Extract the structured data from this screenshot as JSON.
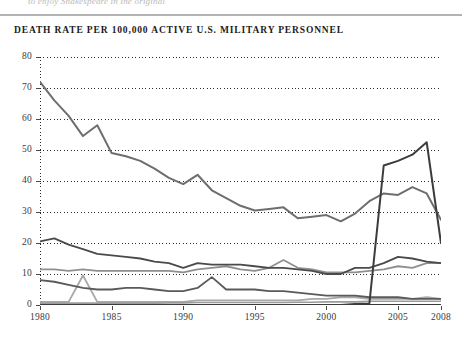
{
  "page": {
    "top_caption": "to enjoy Shakespeare in the original"
  },
  "chart_data": {
    "type": "line",
    "title": "DEATH RATE PER 100,000 ACTIVE U.S. MILITARY PERSONNEL",
    "xlabel": "",
    "ylabel": "",
    "xlim": [
      1980,
      2008
    ],
    "ylim": [
      0,
      80
    ],
    "grid": true,
    "legend": "none",
    "y_ticks": [
      0,
      10,
      20,
      30,
      40,
      50,
      60,
      70,
      80
    ],
    "x_ticks": [
      1980,
      1985,
      1990,
      1995,
      2000,
      2005,
      2008
    ],
    "x": [
      1980,
      1981,
      1982,
      1983,
      1984,
      1985,
      1986,
      1987,
      1988,
      1989,
      1990,
      1991,
      1992,
      1993,
      1994,
      1995,
      1996,
      1997,
      1998,
      1999,
      2000,
      2001,
      2002,
      2003,
      2004,
      2005,
      2006,
      2007,
      2008
    ],
    "series": [
      {
        "name": "total-death-rate",
        "color": "#6e6e6e",
        "width": 2.0,
        "values": [
          72.0,
          66.0,
          61.0,
          54.5,
          58.0,
          49.0,
          48.0,
          46.5,
          44.0,
          41.0,
          39.0,
          42.0,
          37.0,
          34.5,
          32.0,
          30.5,
          31.0,
          31.5,
          28.0,
          28.5,
          29.0,
          27.0,
          29.5,
          33.5,
          36.0,
          35.5,
          38.0,
          36.0,
          27.5
        ]
      },
      {
        "name": "hostile-action-spike",
        "color": "#3c3c3c",
        "width": 2.0,
        "values": [
          0.0,
          0.0,
          0.0,
          0.0,
          0.0,
          0.0,
          0.0,
          0.0,
          0.0,
          0.0,
          0.0,
          0.0,
          0.0,
          0.0,
          0.0,
          0.0,
          0.0,
          0.0,
          0.0,
          0.0,
          0.0,
          0.0,
          0.3,
          0.5,
          45.0,
          46.5,
          48.5,
          52.5,
          20.0
        ]
      },
      {
        "name": "accident-rate",
        "color": "#4a4a4a",
        "width": 1.8,
        "values": [
          20.5,
          21.5,
          19.5,
          18.0,
          16.5,
          16.0,
          15.5,
          15.0,
          14.0,
          13.5,
          12.0,
          13.5,
          13.0,
          13.0,
          13.0,
          12.5,
          12.0,
          12.0,
          11.5,
          11.0,
          10.0,
          10.0,
          12.0,
          12.0,
          13.5,
          15.5,
          15.0,
          14.0,
          13.5
        ]
      },
      {
        "name": "illness-rate",
        "color": "#8f8f8f",
        "width": 1.8,
        "values": [
          11.5,
          11.5,
          11.0,
          11.5,
          11.0,
          11.0,
          11.0,
          11.0,
          11.0,
          11.0,
          10.5,
          11.5,
          12.0,
          12.5,
          11.5,
          11.0,
          12.0,
          14.5,
          12.0,
          11.5,
          10.5,
          10.5,
          10.5,
          11.0,
          11.5,
          12.5,
          12.0,
          13.5,
          13.5
        ]
      },
      {
        "name": "self-inflicted-rate",
        "color": "#5a5a5a",
        "width": 1.8,
        "values": [
          8.0,
          7.5,
          6.5,
          5.5,
          5.0,
          5.0,
          5.5,
          5.5,
          5.0,
          4.5,
          4.5,
          5.5,
          9.0,
          5.0,
          5.0,
          5.0,
          4.5,
          4.5,
          4.0,
          3.5,
          3.0,
          3.0,
          3.0,
          2.5,
          2.5,
          2.5,
          2.0,
          2.0,
          2.0
        ]
      },
      {
        "name": "homicide-rate",
        "color": "#a8a8a8",
        "width": 1.8,
        "values": [
          1.0,
          1.0,
          1.0,
          9.5,
          1.0,
          1.0,
          1.0,
          1.0,
          1.0,
          1.0,
          1.0,
          1.5,
          1.5,
          1.5,
          1.5,
          1.5,
          1.5,
          1.5,
          1.5,
          2.0,
          2.0,
          2.5,
          2.5,
          2.0,
          2.0,
          2.0,
          2.0,
          2.5,
          2.0
        ]
      },
      {
        "name": "other-baseline-rate",
        "color": "#9b9b9b",
        "width": 1.6,
        "values": [
          0.6,
          0.6,
          0.6,
          0.6,
          0.6,
          0.6,
          0.6,
          0.6,
          0.6,
          0.7,
          0.7,
          0.8,
          0.8,
          0.8,
          0.8,
          0.8,
          0.8,
          0.8,
          0.9,
          0.9,
          1.0,
          1.0,
          1.0,
          1.2,
          1.2,
          1.2,
          1.2,
          1.2,
          1.2
        ]
      }
    ]
  }
}
